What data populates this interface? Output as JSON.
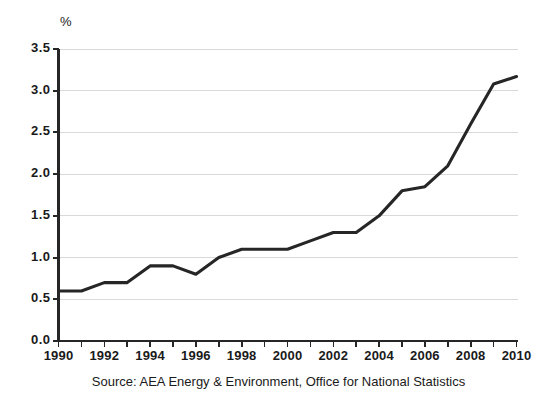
{
  "chart_data": {
    "type": "line",
    "title": "",
    "subtitle": "",
    "xlabel": "",
    "ylabel": "%",
    "unit_label": "%",
    "x": [
      1990,
      1991,
      1992,
      1993,
      1994,
      1995,
      1996,
      1997,
      1998,
      1999,
      2000,
      2001,
      2002,
      2003,
      2004,
      2005,
      2006,
      2007,
      2008,
      2009,
      2010
    ],
    "values": [
      0.6,
      0.6,
      0.7,
      0.7,
      0.9,
      0.9,
      0.8,
      1.0,
      1.1,
      1.1,
      1.1,
      1.2,
      1.3,
      1.3,
      1.5,
      1.8,
      1.85,
      2.1,
      2.6,
      3.08,
      3.17
    ],
    "series": [
      {
        "name": "",
        "values": [
          0.6,
          0.6,
          0.7,
          0.7,
          0.9,
          0.9,
          0.8,
          1.0,
          1.1,
          1.1,
          1.1,
          1.2,
          1.3,
          1.3,
          1.5,
          1.8,
          1.85,
          2.1,
          2.6,
          3.08,
          3.17
        ]
      }
    ],
    "ylim": [
      0.0,
      3.5
    ],
    "xlim": [
      1990,
      2010
    ],
    "ytick_labels": [
      "0.0",
      "0.5",
      "1.0",
      "1.5",
      "2.0",
      "2.5",
      "3.0",
      "3.5"
    ],
    "ytick_values": [
      0.0,
      0.5,
      1.0,
      1.5,
      2.0,
      2.5,
      3.0,
      3.5
    ],
    "xtick_labels": [
      "1990",
      "1992",
      "1994",
      "1996",
      "1998",
      "2000",
      "2002",
      "2004",
      "2006",
      "2008",
      "2010"
    ],
    "xtick_values": [
      1990,
      1992,
      1994,
      1996,
      1998,
      2000,
      2002,
      2004,
      2006,
      2008,
      2010
    ],
    "xminor_tick_values": [
      1990,
      1991,
      1992,
      1993,
      1994,
      1995,
      1996,
      1997,
      1998,
      1999,
      2000,
      2001,
      2002,
      2003,
      2004,
      2005,
      2006,
      2007,
      2008,
      2009,
      2010
    ],
    "grid": "horizontal",
    "legend": "none",
    "line_color": "#262626",
    "grid_color": "#d9d9d9",
    "axis_color": "#262626",
    "background_color": "#ffffff",
    "annotations": []
  },
  "source": {
    "text": "Source: AEA Energy & Environment, Office for National Statistics"
  }
}
